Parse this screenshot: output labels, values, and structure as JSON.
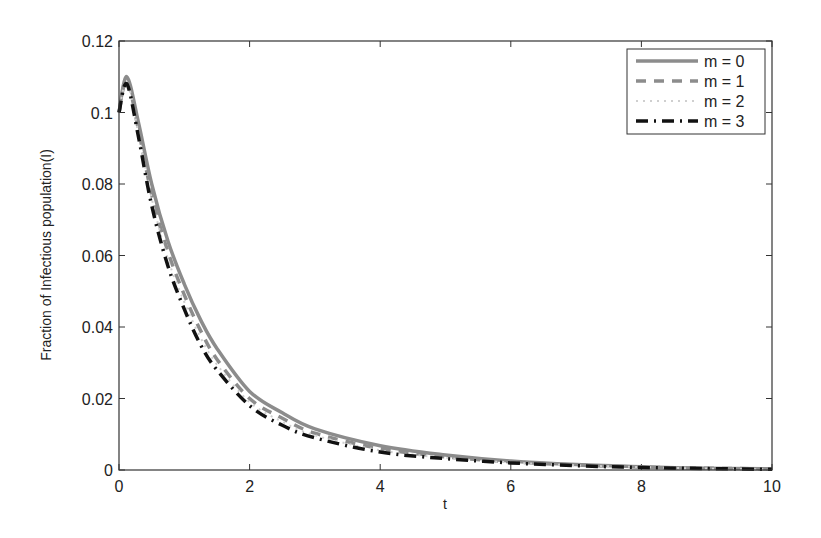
{
  "chart_data": {
    "type": "line",
    "title": "",
    "xlabel": "t",
    "ylabel": "Fraction of Infectious population(I)",
    "xlim": [
      0,
      10
    ],
    "ylim": [
      0,
      0.12
    ],
    "xticks": [
      0,
      2,
      4,
      6,
      8,
      10
    ],
    "xtick_labels": [
      "0",
      "2",
      "4",
      "6",
      "8",
      "10"
    ],
    "yticks": [
      0,
      0.02,
      0.04,
      0.06,
      0.08,
      0.1,
      0.12
    ],
    "ytick_labels": [
      "0",
      "0.02",
      "0.04",
      "0.06",
      "0.08",
      "0.1",
      "0.12"
    ],
    "grid": false,
    "legend_position": "upper right",
    "x": [
      0,
      0.12,
      0.3,
      0.5,
      0.75,
      1.0,
      1.25,
      1.5,
      2.0,
      2.5,
      3.0,
      4.0,
      5.0,
      6.0,
      7.0,
      8.0,
      9.0,
      10.0
    ],
    "series": [
      {
        "name": "m = 0",
        "style": "solid",
        "color": "#8c8c8c",
        "width": 3.5,
        "dash": "",
        "values": [
          0.1,
          0.11,
          0.097,
          0.08,
          0.064,
          0.052,
          0.042,
          0.034,
          0.022,
          0.016,
          0.0115,
          0.0068,
          0.0042,
          0.0025,
          0.0015,
          0.0009,
          0.0005,
          0.0003
        ]
      },
      {
        "name": "m = 1",
        "style": "dashed",
        "color": "#8c8c8c",
        "width": 3.5,
        "dash": "10,8",
        "values": [
          0.1,
          0.109,
          0.095,
          0.077,
          0.061,
          0.049,
          0.039,
          0.031,
          0.02,
          0.0145,
          0.0103,
          0.006,
          0.0037,
          0.0023,
          0.0014,
          0.0008,
          0.0005,
          0.0003
        ]
      },
      {
        "name": "m = 2",
        "style": "dotted",
        "color": "#cfcfcf",
        "width": 2,
        "dash": "2,5",
        "values": [
          0.1,
          0.1085,
          0.094,
          0.076,
          0.059,
          0.047,
          0.037,
          0.0295,
          0.019,
          0.0135,
          0.0097,
          0.0055,
          0.0034,
          0.0021,
          0.0013,
          0.0008,
          0.0004,
          0.0002
        ]
      },
      {
        "name": "m = 3",
        "style": "dashdot",
        "color": "#111111",
        "width": 3.5,
        "dash": "12,6,2,6",
        "values": [
          0.1,
          0.108,
          0.093,
          0.074,
          0.057,
          0.045,
          0.035,
          0.028,
          0.018,
          0.0125,
          0.009,
          0.005,
          0.0032,
          0.002,
          0.0012,
          0.0007,
          0.0004,
          0.0002
        ]
      }
    ]
  }
}
